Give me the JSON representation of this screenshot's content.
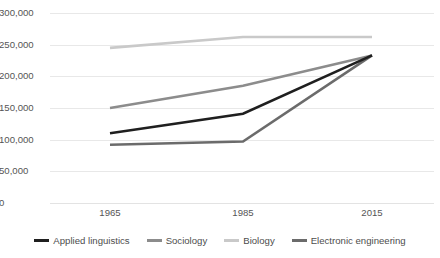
{
  "chart_data": {
    "type": "line",
    "title": "",
    "subtitle": "",
    "xlabel": "",
    "ylabel": "",
    "categories": [
      "1965",
      "1985",
      "2015"
    ],
    "x_tick_labels": [
      "1965",
      "1985",
      "2015"
    ],
    "y_tick_labels": [
      "300,000",
      "250,000",
      "200,000",
      "150,000",
      "100,000",
      "50,000",
      "0"
    ],
    "ylim": [
      0,
      300000
    ],
    "y_ticks": [
      0,
      50000,
      100000,
      150000,
      200000,
      250000,
      300000
    ],
    "grid": true,
    "legend_position": "bottom",
    "series": [
      {
        "name": "Applied linguistics",
        "values": [
          110000,
          141000,
          233000
        ],
        "color": "#1f1f1f"
      },
      {
        "name": "Sociology",
        "values": [
          150000,
          185000,
          233000
        ],
        "color": "#8c8c8c"
      },
      {
        "name": "Biology",
        "values": [
          245000,
          262000,
          262000
        ],
        "color": "#c9c9c9"
      },
      {
        "name": "Electronic engineering",
        "values": [
          92000,
          97000,
          233000
        ],
        "color": "#6b6b6b"
      }
    ]
  },
  "legend": {
    "items": [
      {
        "label": "Applied linguistics",
        "color": "#1f1f1f"
      },
      {
        "label": "Sociology",
        "color": "#8c8c8c"
      },
      {
        "label": "Biology",
        "color": "#c9c9c9"
      },
      {
        "label": "Electronic engineering",
        "color": "#6b6b6b"
      }
    ]
  },
  "colors": {
    "background": "#ffffff",
    "gridline": "#e8e8e8",
    "tick_label": "#555555",
    "legend_label": "#4d4d4d"
  }
}
